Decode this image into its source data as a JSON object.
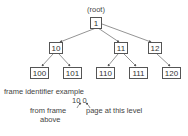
{
  "diagram": {
    "root_label": "(root)",
    "nodes": {
      "root": "1",
      "n10": "10",
      "n11": "11",
      "n12": "12",
      "n100": "100",
      "n101": "101",
      "n110": "110",
      "n111": "111",
      "n120": "120"
    },
    "edges": [
      [
        "1",
        "10"
      ],
      [
        "1",
        "11"
      ],
      [
        "1",
        "12"
      ],
      [
        "10",
        "100"
      ],
      [
        "10",
        "101"
      ],
      [
        "11",
        "110"
      ],
      [
        "11",
        "111"
      ],
      [
        "12",
        "120"
      ]
    ],
    "example": {
      "title": "frame identifier example",
      "identifier": "10 0",
      "left_note_line1": "from frame",
      "left_note_line2": "above",
      "right_note": "page at this level"
    }
  }
}
